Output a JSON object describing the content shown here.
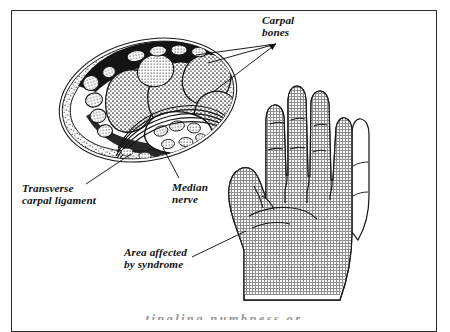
{
  "figure": {
    "background_color": "#ffffff",
    "frame_color": "#2a2a2a",
    "ink_color": "#111111",
    "shading_color": "#9a9a9a"
  },
  "labels": {
    "carpal_bones": "Carpal\nbones",
    "transverse_carpal_ligament": "Transverse\ncarpal ligament",
    "median_nerve": "Median\nnerve",
    "area_affected": "Area affected\nby syndrome"
  },
  "caption": {
    "partial_line": "tingling  numbness  or"
  },
  "anatomy": {
    "cross_section_name": "wrist-cross-section",
    "hand_name": "palm-view-hand",
    "shaded_region_description": "Palmar surface of thumb, index, middle and radial half of ring finger",
    "unshaded_region_description": "Little finger and ulnar border of palm"
  },
  "leader_lines": {
    "carpal_bones_count": 3,
    "transverse_carpal_ligament_count": 1,
    "median_nerve_count": 1,
    "area_affected_count": 1
  }
}
